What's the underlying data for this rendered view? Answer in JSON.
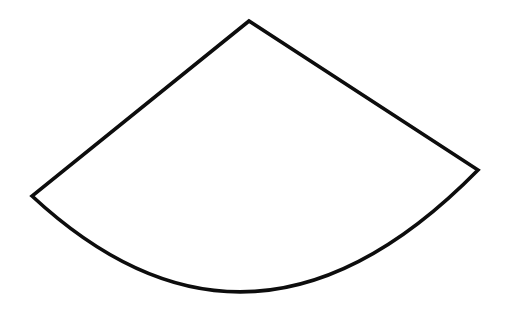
{
  "page": {
    "background_color": "#ffffff",
    "width": 508,
    "height": 319
  },
  "figure": {
    "name": "circular-sector",
    "stroke_color": "#0d0d0d",
    "fill_color": "#ffffff",
    "stroke_width": 3.6,
    "label": "",
    "annotations": []
  },
  "geometry": {
    "apex": {
      "x": 249,
      "y": 21,
      "name": "apex-vertex"
    },
    "left_arc_endpoint": {
      "x": 32,
      "y": 196,
      "name": "left-vertex"
    },
    "right_arc_endpoint": {
      "x": 478,
      "y": 170,
      "name": "right-vertex"
    },
    "arc_lowest_point": {
      "x": 252,
      "y": 296
    },
    "arc_control_point": {
      "x": 252,
      "y": 400
    },
    "path": "M 249 21 L 32 196 Q 252 400 478 170 Z",
    "arc_sample_points": [
      {
        "x": 60,
        "y": 228
      },
      {
        "x": 100,
        "y": 258
      },
      {
        "x": 140,
        "y": 280
      },
      {
        "x": 180,
        "y": 288
      },
      {
        "x": 252,
        "y": 296
      },
      {
        "x": 300,
        "y": 293
      },
      {
        "x": 350,
        "y": 283
      },
      {
        "x": 380,
        "y": 272
      },
      {
        "x": 420,
        "y": 245
      },
      {
        "x": 460,
        "y": 205
      }
    ]
  }
}
